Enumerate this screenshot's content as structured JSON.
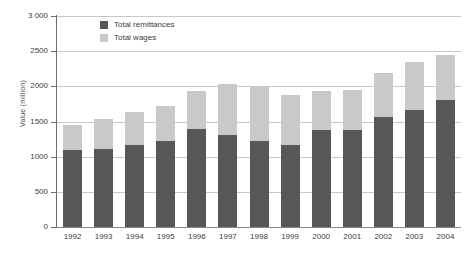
{
  "chart_data": {
    "type": "bar",
    "subtype": "stacked-vertical",
    "title": "",
    "xlabel": "",
    "ylabel": "Value (million)",
    "ylim": [
      0,
      3000
    ],
    "yticks": [
      0,
      500,
      1000,
      1500,
      2000,
      2500,
      3000
    ],
    "ytick_labels": [
      "0",
      "500",
      "1000",
      "1500",
      "2000",
      "2500",
      "3 000"
    ],
    "grid": true,
    "legend_position": "top-left-inside",
    "categories": [
      "1992",
      "1993",
      "1994",
      "1995",
      "1996",
      "1997",
      "1998",
      "1999",
      "2000",
      "2001",
      "2002",
      "2003",
      "2004"
    ],
    "series": [
      {
        "name": "Total remittances",
        "color": "#575757",
        "values": [
          1100,
          1110,
          1160,
          1230,
          1390,
          1310,
          1220,
          1170,
          1380,
          1380,
          1570,
          1670,
          1800
        ]
      },
      {
        "name": "Total wages",
        "color": "#c9c9c9",
        "values": [
          350,
          430,
          470,
          490,
          550,
          720,
          780,
          710,
          560,
          570,
          620,
          680,
          640
        ]
      }
    ],
    "totals": [
      1450,
      1540,
      1630,
      1720,
      1940,
      2030,
      2000,
      1880,
      1940,
      1950,
      2190,
      2350,
      2440
    ]
  },
  "legend": {
    "items": [
      {
        "label": "Total remittances",
        "color": "#575757"
      },
      {
        "label": "Total wages",
        "color": "#c9c9c9"
      }
    ]
  },
  "axes": {
    "y_title": "Value (million)"
  }
}
